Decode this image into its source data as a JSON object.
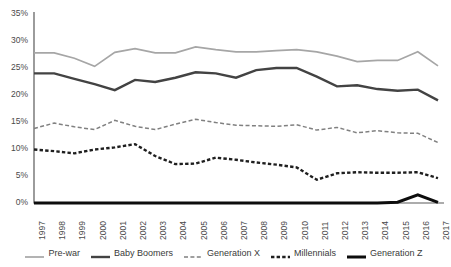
{
  "chart_data": {
    "type": "line",
    "title": "",
    "subtitle": "",
    "xlabel": "",
    "ylabel": "",
    "grid": false,
    "legend_position": "bottom",
    "x": [
      1997,
      1998,
      1999,
      2000,
      2001,
      2002,
      2003,
      2004,
      2005,
      2006,
      2007,
      2008,
      2009,
      2010,
      2011,
      2012,
      2013,
      2014,
      2015,
      2016,
      2017
    ],
    "categories": [
      "1997",
      "1998",
      "1999",
      "2000",
      "2001",
      "2002",
      "2003",
      "2004",
      "2005",
      "2006",
      "2007",
      "2008",
      "2009",
      "2010",
      "2011",
      "2012",
      "2013",
      "2014",
      "2015",
      "2016",
      "2017"
    ],
    "ylim": [
      0,
      35
    ],
    "xlim": [
      1997,
      2017
    ],
    "y_tick_labels": [
      "0%",
      "5%",
      "10%",
      "15%",
      "20%",
      "25%",
      "30%",
      "35%"
    ],
    "y_tick_values": [
      0,
      5,
      10,
      15,
      20,
      25,
      30,
      35
    ],
    "series": [
      {
        "name": "Pre-war",
        "color": "#a6a6a6",
        "style": "solid",
        "width": 1.7,
        "values": [
          27.8,
          27.8,
          26.8,
          25.3,
          27.9,
          28.6,
          27.8,
          27.8,
          28.9,
          28.4,
          28.0,
          28.0,
          28.2,
          28.4,
          28.0,
          27.2,
          26.2,
          26.4,
          26.4,
          28.0,
          25.4
        ]
      },
      {
        "name": "Baby Boomers",
        "color": "#434343",
        "style": "solid",
        "width": 2.4,
        "values": [
          24.0,
          24.0,
          23.0,
          22.0,
          20.9,
          22.8,
          22.4,
          23.2,
          24.2,
          24.0,
          23.2,
          24.6,
          25.0,
          25.0,
          23.4,
          21.6,
          21.8,
          21.1,
          20.8,
          21.0,
          19.0
        ]
      },
      {
        "name": "Generation X",
        "color": "#808080",
        "style": "dashed",
        "width": 1.5,
        "values": [
          13.8,
          14.8,
          14.1,
          13.6,
          15.3,
          14.2,
          13.6,
          14.6,
          15.5,
          14.9,
          14.4,
          14.3,
          14.2,
          14.5,
          13.5,
          14.0,
          13.0,
          13.4,
          13.0,
          12.9,
          11.2
        ]
      },
      {
        "name": "Millennials",
        "color": "#1f1f1f",
        "style": "dotted",
        "width": 2.4,
        "values": [
          9.9,
          9.6,
          9.2,
          9.9,
          10.3,
          10.9,
          8.7,
          7.2,
          7.3,
          8.4,
          8.0,
          7.5,
          7.1,
          6.6,
          4.3,
          5.5,
          5.7,
          5.6,
          5.6,
          5.7,
          4.6
        ]
      },
      {
        "name": "Generation Z",
        "color": "#0d0d0d",
        "style": "solid",
        "width": 3.0,
        "values": [
          0,
          0,
          0,
          0,
          0,
          0,
          0,
          0,
          0,
          0,
          0,
          0,
          0,
          0,
          0,
          0,
          0,
          0,
          0.15,
          1.5,
          0.1
        ]
      }
    ]
  }
}
